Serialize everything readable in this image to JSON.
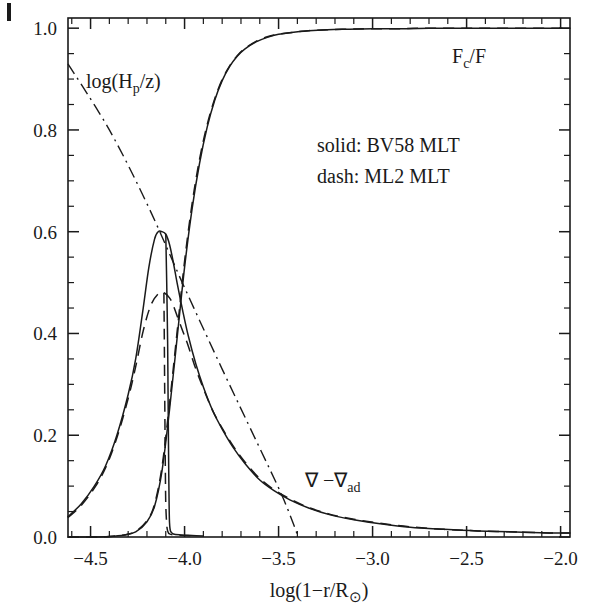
{
  "figure": {
    "corner_artifact": true,
    "background": "#ffffff",
    "ink_color": "#1a1a1a"
  },
  "axes": {
    "x": {
      "label_parts": {
        "pre": "log(1",
        "minus": "−",
        "mid": "r/R",
        "sub": "⊙",
        "post": ")"
      },
      "label_plain": "log(1−r/R⊙)",
      "min": -4.62,
      "max": -1.95,
      "tick_values": [
        -4.5,
        -4.0,
        -3.5,
        -3.0,
        -2.5,
        -2.0
      ],
      "tick_labels": [
        "−4.5",
        "−4.0",
        "−3.5",
        "−3.0",
        "−2.5",
        "−2.0"
      ],
      "minor_step": 0.1
    },
    "y": {
      "label_plain": "",
      "min": 0.0,
      "max": 1.02,
      "tick_values": [
        0.0,
        0.2,
        0.4,
        0.6,
        0.8,
        1.0
      ],
      "tick_labels": [
        "0.0",
        "0.2",
        "0.4",
        "0.6",
        "0.8",
        "1.0"
      ],
      "minor_step": 0.05
    }
  },
  "annotations": {
    "hp_over_z": {
      "pre": "log(H",
      "sub": "p",
      "post": "/z)",
      "plain": "log(Hₚ/z)",
      "x": -4.35,
      "y": 0.885
    },
    "fc_over_f": {
      "pre": "F",
      "sub": "c",
      "post": "/F",
      "plain": "Fᴄ/F",
      "x": -2.33,
      "y": 0.945
    },
    "grad_diff": {
      "pre": "∇ −∇",
      "sub": "ad",
      "post": "",
      "plain": "∇ −∇ₐₔ",
      "x": -3.08,
      "y": 0.115
    },
    "legend_solid": "solid: BV58 MLT",
    "legend_dash": "dash: ML2 MLT"
  },
  "chart_data": {
    "type": "line",
    "title": "",
    "xlabel": "log(1−r/R⊙)",
    "ylabel": "",
    "xlim": [
      -4.62,
      -1.95
    ],
    "ylim": [
      0.0,
      1.02
    ],
    "grid": false,
    "legend_position": "inside-upper-right",
    "legend_entries": [
      "solid: BV58 MLT",
      "dash: ML2 MLT"
    ],
    "series": [
      {
        "name": "F_c/F (BV58 MLT, solid)",
        "style": "solid",
        "x": [
          -4.62,
          -4.5,
          -4.4,
          -4.32,
          -4.26,
          -4.2,
          -4.16,
          -4.12,
          -4.08,
          -4.04,
          -4.0,
          -3.96,
          -3.92,
          -3.88,
          -3.84,
          -3.8,
          -3.76,
          -3.72,
          -3.68,
          -3.62,
          -3.56,
          -3.5,
          -3.42,
          -3.34,
          -3.24,
          -3.12,
          -3.0,
          -2.85,
          -2.7,
          -2.5,
          -2.3,
          -2.1,
          -1.95
        ],
        "y": [
          0.0,
          0.0,
          0.001,
          0.004,
          0.01,
          0.03,
          0.06,
          0.13,
          0.25,
          0.39,
          0.53,
          0.645,
          0.735,
          0.805,
          0.858,
          0.897,
          0.925,
          0.945,
          0.959,
          0.973,
          0.982,
          0.988,
          0.992,
          0.995,
          0.997,
          0.998,
          0.999,
          0.999,
          1.0,
          1.0,
          1.0,
          1.0,
          1.0
        ]
      },
      {
        "name": "F_c/F (ML2 MLT, dash)",
        "style": "dash",
        "x": [
          -4.62,
          -4.5,
          -4.4,
          -4.32,
          -4.26,
          -4.2,
          -4.16,
          -4.12,
          -4.08,
          -4.04,
          -4.0,
          -3.96,
          -3.92,
          -3.88,
          -3.84,
          -3.8,
          -3.76,
          -3.72,
          -3.68,
          -3.62,
          -3.56,
          -3.5,
          -3.42,
          -3.34,
          -3.24,
          -3.12,
          -3.0,
          -2.85,
          -2.7,
          -2.5,
          -2.3,
          -2.1,
          -1.95
        ],
        "y": [
          0.0,
          0.0,
          0.001,
          0.004,
          0.011,
          0.032,
          0.064,
          0.138,
          0.262,
          0.402,
          0.542,
          0.655,
          0.743,
          0.81,
          0.861,
          0.899,
          0.926,
          0.946,
          0.96,
          0.974,
          0.983,
          0.988,
          0.992,
          0.995,
          0.997,
          0.998,
          0.999,
          0.999,
          1.0,
          1.0,
          1.0,
          1.0,
          1.0
        ]
      },
      {
        "name": "grad - grad_ad (BV58 MLT, solid)",
        "style": "solid",
        "x": [
          -4.62,
          -4.55,
          -4.48,
          -4.42,
          -4.36,
          -4.3,
          -4.26,
          -4.22,
          -4.19,
          -4.16,
          -4.14,
          -4.12,
          -4.1,
          -4.08,
          -4.06,
          -4.04,
          -4.01,
          -3.98,
          -3.94,
          -3.9,
          -3.85,
          -3.8,
          -3.74,
          -3.68,
          -3.6,
          -3.52,
          -3.44,
          -3.34,
          -3.22,
          -3.1,
          -2.96,
          -2.8,
          -2.62,
          -2.44,
          -2.24,
          -2.06,
          -1.95
        ],
        "y": [
          0.04,
          0.065,
          0.1,
          0.14,
          0.2,
          0.28,
          0.35,
          0.45,
          0.53,
          0.585,
          0.6,
          0.6,
          0.595,
          0.575,
          0.54,
          0.5,
          0.445,
          0.395,
          0.34,
          0.295,
          0.248,
          0.212,
          0.175,
          0.145,
          0.112,
          0.09,
          0.073,
          0.057,
          0.043,
          0.034,
          0.026,
          0.019,
          0.015,
          0.012,
          0.01,
          0.008,
          0.008
        ]
      },
      {
        "name": "grad - grad_ad (BV58 MLT, solid, inner steep branch)",
        "style": "solid",
        "x": [
          -4.1,
          -4.095,
          -4.09,
          -4.088,
          -4.086,
          -4.084,
          -4.082,
          -4.08,
          -4.075,
          -4.06,
          -4.02,
          -3.96,
          -3.9
        ],
        "y": [
          0.595,
          0.5,
          0.38,
          0.29,
          0.2,
          0.12,
          0.06,
          0.028,
          0.012,
          0.006,
          0.004,
          0.003,
          0.002
        ]
      },
      {
        "name": "grad - grad_ad (ML2 MLT, dash)",
        "style": "dash",
        "x": [
          -4.62,
          -4.55,
          -4.48,
          -4.42,
          -4.36,
          -4.3,
          -4.26,
          -4.22,
          -4.18,
          -4.14,
          -4.11,
          -4.08,
          -4.06,
          -4.04,
          -4.01,
          -3.98,
          -3.94,
          -3.9,
          -3.85,
          -3.8,
          -3.74,
          -3.68,
          -3.6,
          -3.52,
          -3.44,
          -3.34,
          -3.22,
          -3.1,
          -2.96,
          -2.8,
          -2.62,
          -2.44,
          -2.24,
          -2.06,
          -1.95
        ],
        "y": [
          0.038,
          0.062,
          0.096,
          0.136,
          0.195,
          0.272,
          0.335,
          0.405,
          0.455,
          0.478,
          0.48,
          0.47,
          0.455,
          0.435,
          0.405,
          0.375,
          0.33,
          0.292,
          0.248,
          0.214,
          0.178,
          0.148,
          0.115,
          0.092,
          0.075,
          0.058,
          0.044,
          0.035,
          0.027,
          0.02,
          0.015,
          0.012,
          0.01,
          0.008,
          0.008
        ]
      },
      {
        "name": "grad - grad_ad (ML2 MLT, dash, inner steep branch)",
        "style": "dash",
        "x": [
          -4.11,
          -4.108,
          -4.106,
          -4.104,
          -4.102,
          -4.1,
          -4.095,
          -4.09,
          -4.08,
          -4.05,
          -4.0,
          -3.94
        ],
        "y": [
          0.48,
          0.4,
          0.3,
          0.205,
          0.125,
          0.065,
          0.025,
          0.012,
          0.006,
          0.004,
          0.003,
          0.002
        ]
      },
      {
        "name": "log(H_p/z)",
        "style": "dashdot",
        "x": [
          -4.62,
          -4.4,
          -4.2,
          -4.0,
          -3.8,
          -3.62,
          -3.48,
          -3.4
        ],
        "y": [
          0.93,
          0.8,
          0.655,
          0.49,
          0.33,
          0.19,
          0.08,
          0.005
        ]
      }
    ]
  }
}
